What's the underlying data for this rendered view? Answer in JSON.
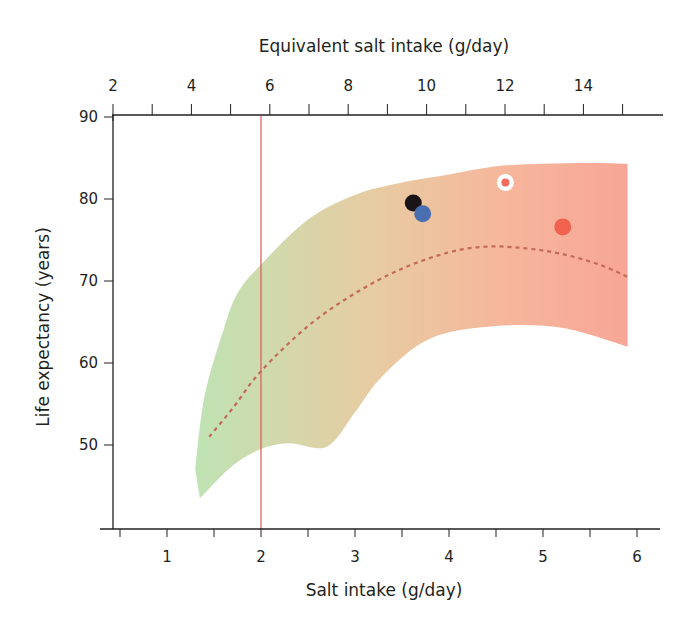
{
  "chart_data": {
    "type": "scatter",
    "title": "",
    "xlabel": "Salt intake (g/day)",
    "ylabel": "Life expectancy (years)",
    "x2label": "Equivalent salt intake (g/day)",
    "xlim": [
      0.5,
      6.2
    ],
    "ylim": [
      40,
      90
    ],
    "x2lim": [
      2,
      15.5
    ],
    "x_ticks": [
      0.5,
      1,
      1.5,
      2,
      2.5,
      3,
      3.5,
      4,
      4.5,
      5,
      5.5,
      6
    ],
    "x_tick_labels": [
      "",
      "1",
      "",
      "2",
      "",
      "3",
      "",
      "4",
      "",
      "5",
      "",
      "6"
    ],
    "x2_ticks": [
      2,
      3,
      4,
      5,
      6,
      7,
      8,
      9,
      10,
      11,
      12,
      13,
      14,
      15
    ],
    "x2_tick_labels": [
      "2",
      "",
      "4",
      "",
      "6",
      "",
      "8",
      "",
      "10",
      "",
      "12",
      "",
      "14",
      ""
    ],
    "y_ticks": [
      40,
      50,
      60,
      70,
      80,
      90
    ],
    "y_tick_labels": [
      "",
      "50",
      "60",
      "70",
      "80",
      "90"
    ],
    "grid": false,
    "legend": null,
    "reference_line": {
      "x": 2.0,
      "color": "#e0605e",
      "label": ""
    },
    "band": {
      "description": "Shaded range of life expectancy vs salt intake, gradient green (low salt) to red (high salt)",
      "upper": [
        [
          1.3,
          47
        ],
        [
          1.4,
          56
        ],
        [
          1.6,
          64
        ],
        [
          1.75,
          68.5
        ],
        [
          2.0,
          72
        ],
        [
          2.5,
          77.5
        ],
        [
          3.0,
          80.5
        ],
        [
          3.5,
          82
        ],
        [
          4.0,
          83
        ],
        [
          4.5,
          84
        ],
        [
          5.0,
          84.3
        ],
        [
          5.5,
          84.4
        ],
        [
          5.9,
          84.3
        ]
      ],
      "lower": [
        [
          1.35,
          43.5
        ],
        [
          1.7,
          47.5
        ],
        [
          2.0,
          49.5
        ],
        [
          2.3,
          50.2
        ],
        [
          2.7,
          49.8
        ],
        [
          3.0,
          54
        ],
        [
          3.3,
          58.5
        ],
        [
          3.8,
          63
        ],
        [
          4.5,
          64.5
        ],
        [
          5.2,
          64.3
        ],
        [
          5.9,
          62
        ]
      ],
      "colors": [
        "#bfe3b4",
        "#e7cca2",
        "#f6b79c",
        "#f8a596"
      ]
    },
    "series": [
      {
        "name": "trend",
        "style": "dashed",
        "color": "#c46a58",
        "x": [
          1.45,
          1.7,
          2.0,
          2.5,
          3.0,
          3.5,
          4.0,
          4.4,
          4.8,
          5.2,
          5.6,
          5.9
        ],
        "y": [
          51,
          54.5,
          59,
          64.5,
          68.5,
          71.5,
          73.5,
          74.2,
          74.0,
          73.3,
          72.0,
          70.5
        ]
      },
      {
        "name": "points",
        "style": "markers",
        "points": [
          {
            "x": 3.62,
            "y": 79.5,
            "color": "#1a1416",
            "ring": false
          },
          {
            "x": 3.72,
            "y": 78.2,
            "color": "#4a6fb0",
            "ring": false
          },
          {
            "x": 4.6,
            "y": 82.0,
            "color": "#f26b5e",
            "ring": true,
            "ring_color": "#ffffff"
          },
          {
            "x": 5.21,
            "y": 76.6,
            "color": "#f26250",
            "ring": false
          }
        ]
      }
    ]
  }
}
